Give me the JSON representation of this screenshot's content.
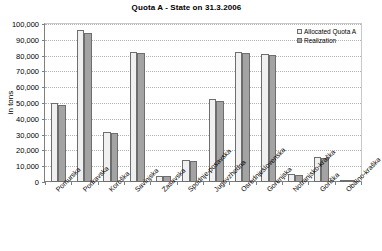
{
  "chart_data": {
    "type": "bar",
    "title": "Quota A - State on 31.3.2006",
    "xlabel": "",
    "ylabel": "in tons",
    "ylim": [
      0,
      100000
    ],
    "ytick_labels": [
      "100,000",
      "90,000",
      "80,000",
      "70,000",
      "60,000",
      "50,000",
      "40,000",
      "30,000",
      "20,000",
      "10,000",
      "0"
    ],
    "ytick_values": [
      100000,
      90000,
      80000,
      70000,
      60000,
      50000,
      40000,
      30000,
      20000,
      10000,
      0
    ],
    "grid": true,
    "legend_position": "top-right-inside",
    "categories": [
      "Pomurska",
      "Podravska",
      "Koroška",
      "Savinjska",
      "Zasavska",
      "Spodnje-posavska",
      "Jugovzhodna",
      "Osrednjeslovenska",
      "Gorenjska",
      "Notranjsko-kraška",
      "Goriška",
      "Obalno-kraška"
    ],
    "series": [
      {
        "name": "Allocated Quota A",
        "color": "#f0f0f0",
        "values": [
          50000,
          96500,
          31500,
          82000,
          4000,
          14000,
          52500,
          82500,
          81000,
          5000,
          16000,
          800
        ]
      },
      {
        "name": "Realization",
        "color": "#a3a3a3",
        "values": [
          48500,
          94000,
          31000,
          81500,
          3800,
          13500,
          51000,
          81500,
          80500,
          4500,
          15500,
          700
        ]
      }
    ]
  }
}
